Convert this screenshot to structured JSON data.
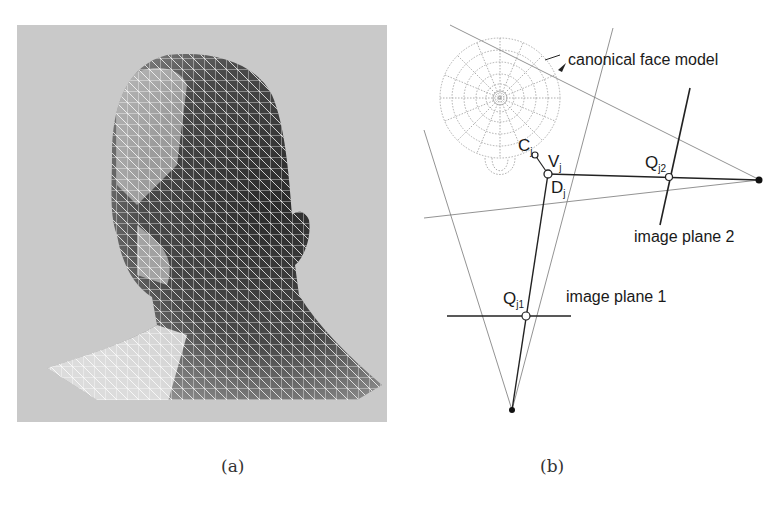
{
  "figure": {
    "panel_a": {
      "caption": "(a)",
      "content": "wireframe 3D head mesh rendering",
      "background_color": "#c9c9c9"
    },
    "panel_b": {
      "caption": "(b)",
      "labels": {
        "canonical_face_model": "canonical face model",
        "image_plane_1": "image plane 1",
        "image_plane_2": "image plane 2",
        "C": "C",
        "C_sub": "j",
        "V": "V",
        "V_sub": "j",
        "D": "D",
        "D_sub": "j",
        "Q1": "Q",
        "Q1_sub": "j1",
        "Q2": "Q",
        "Q2_sub": "j2"
      }
    }
  }
}
